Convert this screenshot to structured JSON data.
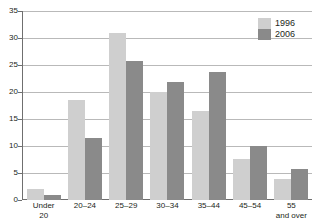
{
  "chart_data": {
    "type": "bar",
    "title": "",
    "xlabel": "",
    "ylabel": "",
    "ylim": [
      0,
      35
    ],
    "ytick_step": 5,
    "yticks": [
      0,
      5,
      10,
      15,
      20,
      25,
      30,
      35
    ],
    "grid": true,
    "legend_position": "top-right",
    "categories": [
      "Under 20",
      "20–24",
      "25–29",
      "30–34",
      "35–44",
      "45–54",
      "55 and over"
    ],
    "category_lines": [
      [
        "Under",
        "20"
      ],
      [
        "20–24",
        ""
      ],
      [
        "25–29",
        ""
      ],
      [
        "30–34",
        ""
      ],
      [
        "35–44",
        ""
      ],
      [
        "45–54",
        ""
      ],
      [
        "55",
        "and over"
      ]
    ],
    "series": [
      {
        "name": "1996",
        "color": "#cfcfcf",
        "values": [
          2.1,
          18.6,
          31.0,
          20.0,
          16.4,
          7.6,
          3.8
        ]
      },
      {
        "name": "2006",
        "color": "#8a8a8a",
        "values": [
          1.0,
          11.4,
          25.8,
          21.9,
          23.7,
          10.0,
          5.8
        ]
      }
    ]
  },
  "legend": {
    "items": [
      {
        "label": "1996",
        "swatch": "light-gray-swatch"
      },
      {
        "label": "2006",
        "swatch": "dark-gray-swatch"
      }
    ]
  },
  "colors": {
    "series_1996": "#cfcfcf",
    "series_2006": "#8a8a8a",
    "gridline": "#b9b9b9",
    "axis": "#6f6f6f",
    "text": "#231f20",
    "background": "#ffffff"
  }
}
